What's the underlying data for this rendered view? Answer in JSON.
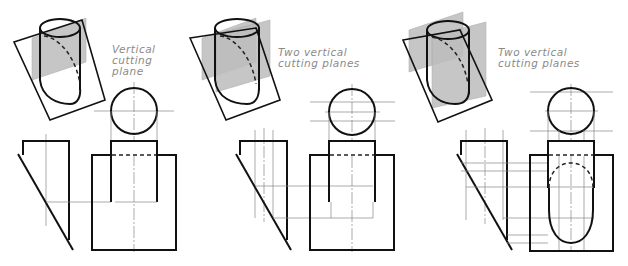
{
  "figures": [
    {
      "id": "fig1",
      "caption_lines": [
        "Vertical",
        "cutting",
        "plane"
      ],
      "description": "Single vertical cutting plane through an obliquely cut cylinder"
    },
    {
      "id": "fig2",
      "caption_lines": [
        "Two vertical",
        "cutting planes"
      ],
      "description": "Two vertical cutting planes through an obliquely cut cylinder"
    },
    {
      "id": "fig3",
      "caption_lines": [
        "Two vertical",
        "cutting planes"
      ],
      "description": "Two vertical cutting planes with resulting elliptical section in front view"
    }
  ],
  "colors": {
    "line": "#111111",
    "construction": "#888888",
    "plane_fill": "#bdbdbd",
    "caption": "#8a8a8a"
  }
}
